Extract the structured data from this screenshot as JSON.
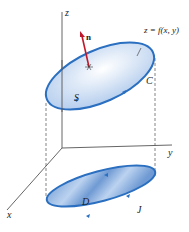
{
  "figure": {
    "labels": {
      "z_axis": "z",
      "y_axis": "y",
      "x_axis": "x",
      "normal": "n",
      "surface_eq": "z = f(x, y)",
      "surface": "S",
      "curve": "C",
      "region": "D",
      "boundary": "J"
    },
    "colors": {
      "ellipse_stroke": "#2a6fc0",
      "surface_fill": "#c9dcf2",
      "region_fill": "#7fa9db",
      "normal_arrow": "#c0182a",
      "axis": "#555555"
    }
  }
}
